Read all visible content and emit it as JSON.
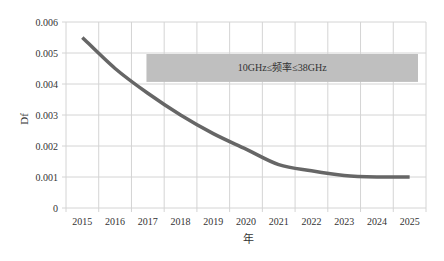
{
  "chart_data": {
    "type": "line",
    "title": "",
    "xlabel": "年",
    "ylabel": "Df",
    "categories": [
      "2015",
      "2016",
      "2017",
      "2018",
      "2019",
      "2020",
      "2021",
      "2022",
      "2023",
      "2024",
      "2025"
    ],
    "series": [
      {
        "name": "Df",
        "values": [
          0.0055,
          0.0045,
          0.0037,
          0.003,
          0.0024,
          0.0019,
          0.0014,
          0.0012,
          0.00105,
          0.001,
          0.001
        ],
        "color": "#666666"
      }
    ],
    "ylim": [
      0,
      0.006
    ],
    "yticks": [
      "0",
      "0.001",
      "0.002",
      "0.003",
      "0.004",
      "0.005",
      "0.006"
    ],
    "grid": true,
    "legend": "none",
    "annotations": [
      {
        "text": "10GHz≤频率≤38GHz",
        "type": "band",
        "y_from": 0.0041,
        "y_to": 0.005,
        "x_from": "2017",
        "x_to": "2025",
        "color": "#bfbfbf"
      }
    ]
  }
}
